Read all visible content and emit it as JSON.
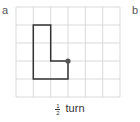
{
  "labels": {
    "a": "a",
    "b": "b"
  },
  "grid": {
    "columns": 6,
    "rows": 5,
    "line_color": "#d9d9d9"
  },
  "shape": {
    "type": "L-shape",
    "vertices_grid": [
      [
        1,
        1
      ],
      [
        2,
        1
      ],
      [
        2,
        3
      ],
      [
        3,
        3
      ],
      [
        3,
        4
      ],
      [
        1,
        4
      ]
    ],
    "stroke_color": "#333333",
    "center_of_rotation": [
      3,
      3
    ],
    "center_dot_color": "#555555"
  },
  "caption": {
    "numerator": "1",
    "denominator": "2",
    "text": "turn"
  }
}
